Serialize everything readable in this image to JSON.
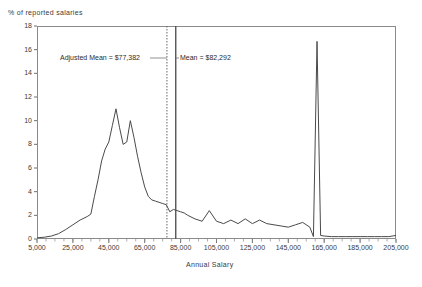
{
  "chart_data": {
    "type": "line",
    "title": "",
    "xlabel": "Annual Salary",
    "ylabel": "% of reported salaries",
    "xlim": [
      5000,
      205000
    ],
    "ylim": [
      0,
      18
    ],
    "grid": false,
    "legend": "none",
    "xticks": [
      "5,000",
      "25,000",
      "45,000",
      "65,000",
      "85,000",
      "105,000",
      "125,000",
      "145,000",
      "165,000",
      "185,000",
      "205,000"
    ],
    "xtick_values": [
      5000,
      25000,
      45000,
      65000,
      85000,
      105000,
      125000,
      145000,
      165000,
      185000,
      205000
    ],
    "yticks": [
      "0",
      "2",
      "4",
      "6",
      "8",
      "10",
      "12",
      "14",
      "16",
      "18"
    ],
    "ytick_values": [
      0,
      2,
      4,
      6,
      8,
      10,
      12,
      14,
      16,
      18
    ],
    "series": [
      {
        "name": "% of reported salaries",
        "color": "#4a4a4a",
        "x": [
          5000,
          9000,
          13000,
          17000,
          21000,
          25000,
          29000,
          33000,
          35000,
          37000,
          39000,
          41000,
          43000,
          45000,
          47000,
          49000,
          51000,
          53000,
          55000,
          57000,
          59000,
          61000,
          63000,
          65000,
          67000,
          69000,
          71000,
          73000,
          75000,
          77000,
          79000,
          81000,
          83000,
          85000,
          87000,
          89000,
          93000,
          97000,
          101000,
          105000,
          109000,
          113000,
          117000,
          121000,
          125000,
          129000,
          133000,
          137000,
          141000,
          145000,
          149000,
          153000,
          157000,
          159000,
          161000,
          163000,
          165000,
          169000,
          173000,
          177000,
          181000,
          185000,
          189000,
          193000,
          197000,
          201000,
          205000
        ],
        "values": [
          0.1,
          0.15,
          0.25,
          0.45,
          0.8,
          1.2,
          1.6,
          1.9,
          2.1,
          3.6,
          5.0,
          6.6,
          7.6,
          8.2,
          9.6,
          11.0,
          9.4,
          8.0,
          8.2,
          10.0,
          8.6,
          7.0,
          5.6,
          4.4,
          3.6,
          3.3,
          3.2,
          3.1,
          3.0,
          2.9,
          2.3,
          2.5,
          2.4,
          2.3,
          2.2,
          2.0,
          1.7,
          1.5,
          2.4,
          1.5,
          1.3,
          1.6,
          1.3,
          1.7,
          1.3,
          1.6,
          1.3,
          1.2,
          1.1,
          1.0,
          1.2,
          1.4,
          1.0,
          0.2,
          16.7,
          0.3,
          0.25,
          0.2,
          0.2,
          0.2,
          0.2,
          0.2,
          0.2,
          0.2,
          0.2,
          0.2,
          0.3
        ]
      }
    ],
    "annotations": [
      {
        "id": "adjusted-mean",
        "label": "Adjusted Mean = $77,382",
        "value": 77382,
        "line_style": "dotted",
        "color": "#555555"
      },
      {
        "id": "mean",
        "label": "Mean = $82,292",
        "value": 82292,
        "line_style": "solid",
        "color": "#555555"
      }
    ]
  }
}
